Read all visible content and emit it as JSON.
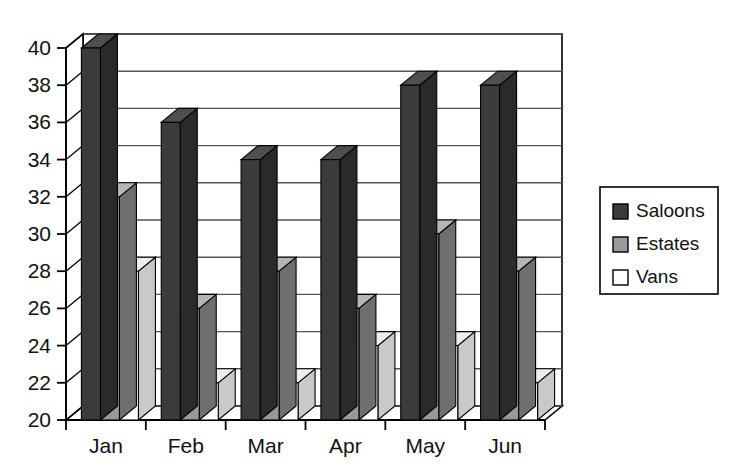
{
  "chart_data": {
    "type": "bar",
    "title": "",
    "subtitle": "",
    "xlabel": "",
    "ylabel": "",
    "categories": [
      "Jan",
      "Feb",
      "Mar",
      "Apr",
      "May",
      "Jun"
    ],
    "series": [
      {
        "name": "Saloons",
        "values": [
          40,
          36,
          34,
          34,
          38,
          38
        ],
        "color": "#3b3b3b"
      },
      {
        "name": "Estates",
        "values": [
          32,
          26,
          28,
          26,
          30,
          28
        ],
        "color": "#999999"
      },
      {
        "name": "Vans",
        "values": [
          28,
          22,
          22,
          24,
          24,
          22
        ],
        "color": "#ffffff"
      }
    ],
    "ylim": [
      20,
      40
    ],
    "ytick_step": 2,
    "ytick_labels": [
      "20",
      "22",
      "24",
      "26",
      "28",
      "30",
      "32",
      "34",
      "36",
      "38",
      "40"
    ],
    "grid": true,
    "grid_axis": "y",
    "legend_position": "right",
    "style": "3d-column",
    "axis_color": "#000000",
    "grid_color": "#555555",
    "background": "#ffffff"
  },
  "legend": {
    "entries": [
      {
        "label": "Saloons",
        "swatch": "#3b3b3b"
      },
      {
        "label": "Estates",
        "swatch": "#999999"
      },
      {
        "label": "Vans",
        "swatch": "#ffffff"
      }
    ]
  }
}
